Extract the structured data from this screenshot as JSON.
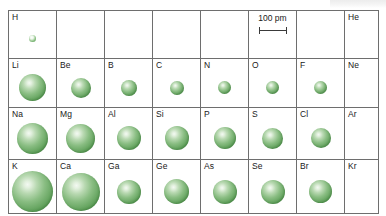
{
  "figure": {
    "sphere_color": "#5c9e57",
    "sphere_highlight": "#f3f9f2",
    "grid_line_color": "#6e6e6e",
    "background": "#ffffff"
  },
  "scale": {
    "label": "100 pm",
    "value": 100,
    "unit": "pm",
    "bar_px": 28
  },
  "chart_data": {
    "type": "table",
    "xlabel": "Group",
    "ylabel": "Period",
    "value_unit": "pm",
    "scale_reference": "100 pm",
    "columns": [
      "1A",
      "2A",
      "3A",
      "4A",
      "5A",
      "6A",
      "7A",
      "8A"
    ],
    "rows": [
      "1",
      "2",
      "3",
      "4"
    ],
    "cells": [
      [
        {
          "symbol": "H",
          "radius_px": 7,
          "radius_pm": 37,
          "has_sphere": true
        },
        {
          "symbol": "",
          "radius_px": 0,
          "radius_pm": null,
          "has_sphere": false
        },
        {
          "symbol": "",
          "radius_px": 0,
          "radius_pm": null,
          "has_sphere": false
        },
        {
          "symbol": "",
          "radius_px": 0,
          "radius_pm": null,
          "has_sphere": false
        },
        {
          "symbol": "",
          "radius_px": 0,
          "radius_pm": null,
          "has_sphere": false
        },
        {
          "symbol": "",
          "radius_px": 0,
          "radius_pm": null,
          "has_sphere": false,
          "is_scale_cell": true
        },
        {
          "symbol": "",
          "radius_px": 0,
          "radius_pm": null,
          "has_sphere": false
        },
        {
          "symbol": "He",
          "radius_px": 0,
          "radius_pm": null,
          "has_sphere": false
        }
      ],
      [
        {
          "symbol": "Li",
          "radius_px": 27,
          "radius_pm": 152,
          "has_sphere": true
        },
        {
          "symbol": "Be",
          "radius_px": 20,
          "radius_pm": 112,
          "has_sphere": true
        },
        {
          "symbol": "B",
          "radius_px": 16,
          "radius_pm": 85,
          "has_sphere": true
        },
        {
          "symbol": "C",
          "radius_px": 14,
          "radius_pm": 77,
          "has_sphere": true
        },
        {
          "symbol": "N",
          "radius_px": 13,
          "radius_pm": 75,
          "has_sphere": true
        },
        {
          "symbol": "O",
          "radius_px": 13,
          "radius_pm": 73,
          "has_sphere": true
        },
        {
          "symbol": "F",
          "radius_px": 13,
          "radius_pm": 72,
          "has_sphere": true
        },
        {
          "symbol": "Ne",
          "radius_px": 0,
          "radius_pm": null,
          "has_sphere": false
        }
      ],
      [
        {
          "symbol": "Na",
          "radius_px": 31,
          "radius_pm": 186,
          "has_sphere": true
        },
        {
          "symbol": "Mg",
          "radius_px": 29,
          "radius_pm": 160,
          "has_sphere": true
        },
        {
          "symbol": "Al",
          "radius_px": 24,
          "radius_pm": 143,
          "has_sphere": true
        },
        {
          "symbol": "Si",
          "radius_px": 24,
          "radius_pm": 118,
          "has_sphere": true
        },
        {
          "symbol": "P",
          "radius_px": 22,
          "radius_pm": 110,
          "has_sphere": true
        },
        {
          "symbol": "S",
          "radius_px": 21,
          "radius_pm": 103,
          "has_sphere": true
        },
        {
          "symbol": "Cl",
          "radius_px": 20,
          "radius_pm": 100,
          "has_sphere": true
        },
        {
          "symbol": "Ar",
          "radius_px": 0,
          "radius_pm": null,
          "has_sphere": false
        }
      ],
      [
        {
          "symbol": "K",
          "radius_px": 41,
          "radius_pm": 227,
          "has_sphere": true
        },
        {
          "symbol": "Ca",
          "radius_px": 38,
          "radius_pm": 197,
          "has_sphere": true
        },
        {
          "symbol": "Ga",
          "radius_px": 24,
          "radius_pm": 135,
          "has_sphere": true
        },
        {
          "symbol": "Ge",
          "radius_px": 25,
          "radius_pm": 122,
          "has_sphere": true
        },
        {
          "symbol": "As",
          "radius_px": 24,
          "radius_pm": 120,
          "has_sphere": true
        },
        {
          "symbol": "Se",
          "radius_px": 24,
          "radius_pm": 119,
          "has_sphere": true
        },
        {
          "symbol": "Br",
          "radius_px": 23,
          "radius_pm": 114,
          "has_sphere": true
        },
        {
          "symbol": "Kr",
          "radius_px": 0,
          "radius_pm": null,
          "has_sphere": false
        }
      ]
    ]
  }
}
